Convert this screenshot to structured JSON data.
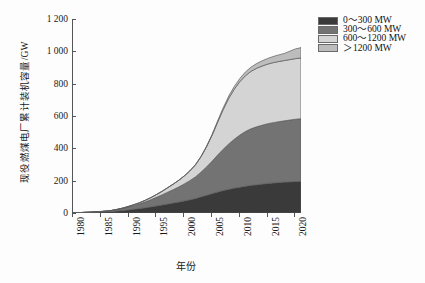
{
  "chart_data": {
    "type": "area",
    "stacked": true,
    "title": "",
    "xlabel": "年份",
    "ylabel": "现役燃煤电厂累计装机容量/GW",
    "xlim": [
      1980,
      2021
    ],
    "ylim": [
      0,
      1200
    ],
    "grid": false,
    "legend_position": "right",
    "xticks": [
      "1980",
      "1985",
      "1990",
      "1995",
      "2000",
      "2005",
      "2010",
      "2015",
      "2020"
    ],
    "xtick_values": [
      1980,
      1985,
      1990,
      1995,
      2000,
      2005,
      2010,
      2015,
      2020
    ],
    "yticks": [
      "0",
      "200",
      "400",
      "600",
      "800",
      "1 000",
      "1 200"
    ],
    "ytick_values": [
      0,
      200,
      400,
      600,
      800,
      1000,
      1200
    ],
    "x": [
      1980,
      1981,
      1982,
      1983,
      1984,
      1985,
      1986,
      1987,
      1988,
      1989,
      1990,
      1991,
      1992,
      1993,
      1994,
      1995,
      1996,
      1997,
      1998,
      1999,
      2000,
      2001,
      2002,
      2003,
      2004,
      2005,
      2006,
      2007,
      2008,
      2009,
      2010,
      2011,
      2012,
      2013,
      2014,
      2015,
      2016,
      2017,
      2018,
      2019,
      2020,
      2021
    ],
    "series": [
      {
        "name": "0~300 MW",
        "color": "#3a3a3a",
        "values": [
          1,
          2,
          3,
          4,
          5,
          6,
          8,
          10,
          13,
          16,
          20,
          24,
          28,
          33,
          38,
          44,
          50,
          56,
          62,
          68,
          75,
          82,
          90,
          100,
          110,
          120,
          130,
          139,
          147,
          154,
          160,
          166,
          171,
          175,
          179,
          183,
          186,
          189,
          191,
          193,
          195,
          196
        ]
      },
      {
        "name": "300~600 MW",
        "color": "#737373",
        "values": [
          0,
          0,
          1,
          1,
          2,
          3,
          4,
          6,
          9,
          13,
          18,
          23,
          29,
          36,
          44,
          53,
          62,
          72,
          82,
          93,
          105,
          118,
          133,
          152,
          175,
          200,
          228,
          255,
          280,
          302,
          322,
          338,
          350,
          358,
          364,
          369,
          373,
          376,
          379,
          382,
          385,
          387
        ]
      },
      {
        "name": "600~1200 MW",
        "color": "#d4d4d4",
        "values": [
          0,
          0,
          0,
          0,
          0,
          0,
          0,
          0,
          1,
          2,
          3,
          5,
          7,
          10,
          13,
          17,
          22,
          28,
          34,
          41,
          49,
          60,
          74,
          95,
          124,
          160,
          203,
          245,
          282,
          310,
          330,
          345,
          355,
          362,
          366,
          369,
          371,
          372,
          373,
          374,
          375,
          376
        ]
      },
      {
        "name": ">1200 MW",
        "color": "#bdbdbd",
        "values": [
          0,
          0,
          0,
          0,
          0,
          0,
          0,
          0,
          0,
          0,
          0,
          0,
          0,
          0,
          0,
          0,
          0,
          0,
          0,
          0,
          0,
          0,
          1,
          2,
          3,
          5,
          8,
          11,
          14,
          17,
          20,
          23,
          26,
          29,
          32,
          35,
          38,
          41,
          44,
          52,
          60,
          64
        ]
      }
    ],
    "totals_note": "stacked total reaches about 1 020 GW in 2020"
  },
  "legend": {
    "items": [
      {
        "label": "0～300 MW",
        "color": "#3a3a3a"
      },
      {
        "label": "300～600 MW",
        "color": "#737373"
      },
      {
        "label": "600～1200 MW",
        "color": "#d4d4d4"
      },
      {
        "label": "＞1200 MW",
        "color": "#bdbdbd"
      }
    ]
  },
  "axis": {
    "y_title": "现役燃煤电厂累计装机容量/GW",
    "x_title": "年份"
  }
}
